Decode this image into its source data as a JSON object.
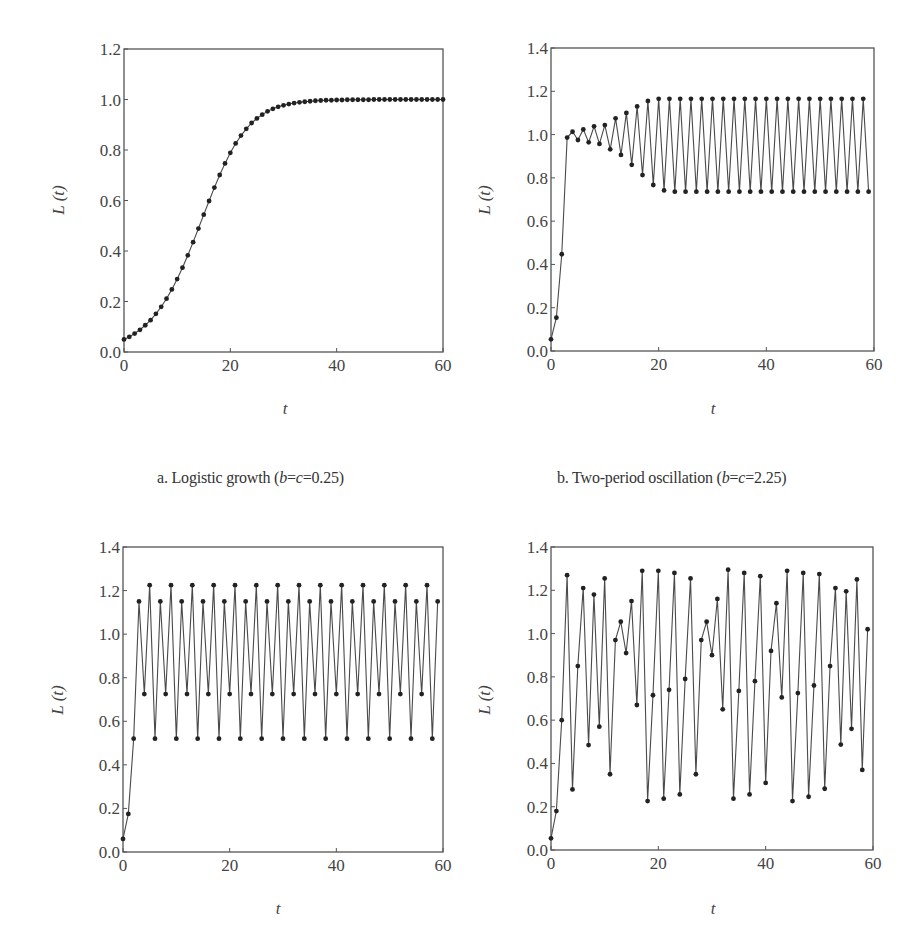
{
  "figure": {
    "captions": [
      {
        "id": "a",
        "prefix": "a. Logistic growth (",
        "var1": "b",
        "eq1": "=",
        "var2": "c",
        "eq2": "=0.25)"
      },
      {
        "id": "b",
        "prefix": "b. Two-period oscillation (",
        "var1": "b",
        "eq1": "=",
        "var2": "c",
        "eq2": "=2.25)"
      }
    ],
    "colors": {
      "axis": "#555555",
      "line": "#4a4a4a",
      "marker": "#222222",
      "text": "#444444"
    }
  },
  "chart_data": [
    {
      "id": "a",
      "type": "line",
      "title": "a. Logistic growth (b=c=0.25)",
      "xlabel": "t",
      "ylabel": "L (t)",
      "xlim": [
        0,
        60
      ],
      "ylim": [
        0,
        1.2
      ],
      "xticks": [
        0,
        20,
        40,
        60
      ],
      "yticks": [
        0.0,
        0.2,
        0.4,
        0.6,
        0.8,
        1.0,
        1.2
      ],
      "ytick_labels": [
        "0.0",
        "0.2",
        "0.4",
        "0.6",
        "0.8",
        "1.0",
        "1.2"
      ],
      "xtick_labels": [
        "0",
        "20",
        "40",
        "60"
      ],
      "grid": false,
      "markers": true,
      "x": [
        0,
        1,
        2,
        3,
        4,
        5,
        6,
        7,
        8,
        9,
        10,
        11,
        12,
        13,
        14,
        15,
        16,
        17,
        18,
        19,
        20,
        21,
        22,
        23,
        24,
        25,
        26,
        27,
        28,
        29,
        30,
        31,
        32,
        33,
        34,
        35,
        36,
        37,
        38,
        39,
        40,
        41,
        42,
        43,
        44,
        45,
        46,
        47,
        48,
        49,
        50,
        51,
        52,
        53,
        54,
        55,
        56,
        57,
        58,
        59,
        60
      ],
      "values": [
        0.05,
        0.06,
        0.073,
        0.088,
        0.106,
        0.126,
        0.151,
        0.179,
        0.211,
        0.248,
        0.289,
        0.334,
        0.383,
        0.435,
        0.489,
        0.544,
        0.598,
        0.651,
        0.701,
        0.747,
        0.789,
        0.826,
        0.857,
        0.884,
        0.907,
        0.925,
        0.94,
        0.953,
        0.963,
        0.971,
        0.977,
        0.982,
        0.986,
        0.989,
        0.991,
        0.993,
        0.995,
        0.996,
        0.997,
        0.997,
        0.998,
        0.998,
        0.999,
        0.999,
        0.999,
        0.999,
        0.999,
        1.0,
        1.0,
        1.0,
        1.0,
        1.0,
        1.0,
        1.0,
        1.0,
        1.0,
        1.0,
        1.0,
        1.0,
        1.0,
        1.0
      ]
    },
    {
      "id": "b",
      "type": "line",
      "title": "b. Two-period oscillation (b=c=2.25)",
      "xlabel": "t",
      "ylabel": "L (t)",
      "xlim": [
        0,
        60
      ],
      "ylim": [
        0,
        1.4
      ],
      "xticks": [
        0,
        20,
        40,
        60
      ],
      "yticks": [
        0.0,
        0.2,
        0.4,
        0.6,
        0.8,
        1.0,
        1.2,
        1.4
      ],
      "ytick_labels": [
        "0.0",
        "0.2",
        "0.4",
        "0.6",
        "0.8",
        "1.0",
        "1.2",
        "1.4"
      ],
      "xtick_labels": [
        "0",
        "20",
        "40",
        "60"
      ],
      "grid": false,
      "markers": true,
      "x": [
        0,
        1,
        2,
        3,
        4,
        5,
        6,
        7,
        8,
        9,
        10,
        11,
        12,
        13,
        14,
        15,
        16,
        17,
        18,
        19,
        20,
        21,
        22,
        23,
        24,
        25,
        26,
        27,
        28,
        29,
        30,
        31,
        32,
        33,
        34,
        35,
        36,
        37,
        38,
        39,
        40,
        41,
        42,
        43,
        44,
        45,
        46,
        47,
        48,
        49,
        50,
        51,
        52,
        53,
        54,
        55,
        56,
        57,
        58,
        59
      ],
      "values": [
        0.054,
        0.154,
        0.447,
        0.986,
        1.013,
        0.975,
        1.024,
        0.964,
        1.038,
        0.957,
        1.044,
        0.932,
        1.075,
        0.906,
        1.1,
        0.86,
        1.13,
        0.813,
        1.155,
        0.767,
        1.165,
        0.742,
        1.165,
        0.736,
        1.165,
        0.736,
        1.165,
        0.736,
        1.165,
        0.736,
        1.165,
        0.736,
        1.165,
        0.736,
        1.165,
        0.736,
        1.165,
        0.736,
        1.165,
        0.736,
        1.165,
        0.736,
        1.165,
        0.736,
        1.165,
        0.736,
        1.165,
        0.736,
        1.165,
        0.736,
        1.165,
        0.736,
        1.165,
        0.736,
        1.165,
        0.736,
        1.165,
        0.736,
        1.165,
        0.736
      ]
    },
    {
      "id": "c",
      "type": "line",
      "title": "",
      "xlabel": "t",
      "ylabel": "L (t)",
      "xlim": [
        0,
        60
      ],
      "ylim": [
        0,
        1.4
      ],
      "xticks": [
        0,
        20,
        40,
        60
      ],
      "yticks": [
        0.0,
        0.2,
        0.4,
        0.6,
        0.8,
        1.0,
        1.2,
        1.4
      ],
      "ytick_labels": [
        "0.0",
        "0.2",
        "0.4",
        "0.6",
        "0.8",
        "1.0",
        "1.2",
        "1.4"
      ],
      "xtick_labels": [
        "0",
        "20",
        "40",
        "60"
      ],
      "grid": false,
      "markers": true,
      "x": [
        0,
        1,
        2,
        3,
        4,
        5,
        6,
        7,
        8,
        9,
        10,
        11,
        12,
        13,
        14,
        15,
        16,
        17,
        18,
        19,
        20,
        21,
        22,
        23,
        24,
        25,
        26,
        27,
        28,
        29,
        30,
        31,
        32,
        33,
        34,
        35,
        36,
        37,
        38,
        39,
        40,
        41,
        42,
        43,
        44,
        45,
        46,
        47,
        48,
        49,
        50,
        51,
        52,
        53,
        54,
        55,
        56,
        57,
        58,
        59
      ],
      "values": [
        0.06,
        0.175,
        0.52,
        1.15,
        0.725,
        1.225,
        0.52,
        1.15,
        0.725,
        1.225,
        0.52,
        1.15,
        0.725,
        1.225,
        0.52,
        1.15,
        0.725,
        1.225,
        0.52,
        1.15,
        0.725,
        1.225,
        0.52,
        1.15,
        0.725,
        1.225,
        0.52,
        1.15,
        0.725,
        1.225,
        0.52,
        1.15,
        0.725,
        1.225,
        0.52,
        1.15,
        0.725,
        1.225,
        0.52,
        1.15,
        0.725,
        1.225,
        0.52,
        1.15,
        0.725,
        1.225,
        0.52,
        1.15,
        0.725,
        1.225,
        0.52,
        1.15,
        0.725,
        1.225,
        0.52,
        1.15,
        0.725,
        1.225,
        0.52,
        1.15
      ]
    },
    {
      "id": "d",
      "type": "line",
      "title": "",
      "xlabel": "t",
      "ylabel": "L (t)",
      "xlim": [
        0,
        60
      ],
      "ylim": [
        0,
        1.4
      ],
      "xticks": [
        0,
        20,
        40,
        60
      ],
      "yticks": [
        0.0,
        0.2,
        0.4,
        0.6,
        0.8,
        1.0,
        1.2,
        1.4
      ],
      "ytick_labels": [
        "0.0",
        "0.2",
        "0.4",
        "0.6",
        "0.8",
        "1.0",
        "1.2",
        "1.4"
      ],
      "xtick_labels": [
        "0",
        "20",
        "40",
        "60"
      ],
      "grid": false,
      "markers": true,
      "x": [
        0,
        1,
        2,
        3,
        4,
        5,
        6,
        7,
        8,
        9,
        10,
        11,
        12,
        13,
        14,
        15,
        16,
        17,
        18,
        19,
        20,
        21,
        22,
        23,
        24,
        25,
        26,
        27,
        28,
        29,
        30,
        31,
        32,
        33,
        34,
        35,
        36,
        37,
        38,
        39,
        40,
        41,
        42,
        43,
        44,
        45,
        46,
        47,
        48,
        49,
        50,
        51,
        52,
        53,
        54,
        55,
        56,
        57,
        58,
        59
      ],
      "values": [
        0.054,
        0.18,
        0.6,
        1.27,
        0.28,
        0.85,
        1.21,
        0.485,
        1.18,
        0.57,
        1.255,
        0.35,
        0.97,
        1.055,
        0.91,
        1.15,
        0.67,
        1.29,
        0.226,
        0.715,
        1.29,
        0.237,
        0.74,
        1.28,
        0.257,
        0.79,
        1.255,
        0.35,
        0.97,
        1.055,
        0.9,
        1.16,
        0.65,
        1.295,
        0.237,
        0.735,
        1.28,
        0.257,
        0.78,
        1.265,
        0.31,
        0.92,
        1.14,
        0.705,
        1.29,
        0.226,
        0.725,
        1.28,
        0.246,
        0.76,
        1.275,
        0.283,
        0.85,
        1.21,
        0.487,
        1.195,
        0.56,
        1.25,
        0.37,
        1.02
      ]
    }
  ],
  "layout": {
    "panels": [
      {
        "id": "a",
        "box": [
          124,
          49,
          443,
          352
        ],
        "ylabel_pos": [
          64,
          200
        ],
        "xlabel_pos": [
          285,
          414
        ]
      },
      {
        "id": "b",
        "box": [
          551,
          48,
          874,
          351
        ],
        "ylabel_pos": [
          490,
          200
        ],
        "xlabel_pos": [
          713,
          414
        ]
      },
      {
        "id": "c",
        "box": [
          123,
          547,
          443,
          852
        ],
        "ylabel_pos": [
          63,
          700
        ],
        "xlabel_pos": [
          278,
          914
        ]
      },
      {
        "id": "d",
        "box": [
          551,
          547,
          873,
          850
        ],
        "ylabel_pos": [
          490,
          700
        ],
        "xlabel_pos": [
          713,
          914
        ]
      }
    ],
    "captions": [
      {
        "id": "a",
        "left": 157,
        "top": 469
      },
      {
        "id": "b",
        "left": 557,
        "top": 469
      }
    ]
  }
}
